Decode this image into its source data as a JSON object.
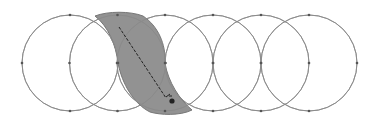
{
  "canvas": {
    "width": 374,
    "height": 119,
    "background": "#ffffff"
  },
  "circles": [
    {
      "cx": 70,
      "cy": 63,
      "r": 48
    },
    {
      "cx": 117.5,
      "cy": 63,
      "r": 48
    },
    {
      "cx": 165,
      "cy": 63,
      "r": 48
    },
    {
      "cx": 213,
      "cy": 63,
      "r": 48
    },
    {
      "cx": 261,
      "cy": 63,
      "r": 48
    },
    {
      "cx": 309,
      "cy": 63,
      "r": 48
    }
  ],
  "colors": {
    "stroke": "#8a8a8a",
    "node": "#555555",
    "fill_shape": "#8c8c8c",
    "shape_edge": "#777777",
    "guide": "#222222"
  },
  "selected_shape": {
    "label": "sheared crescent"
  },
  "guide_line": {
    "x1": 119,
    "y1": 27,
    "x2": 166,
    "y2": 98
  }
}
